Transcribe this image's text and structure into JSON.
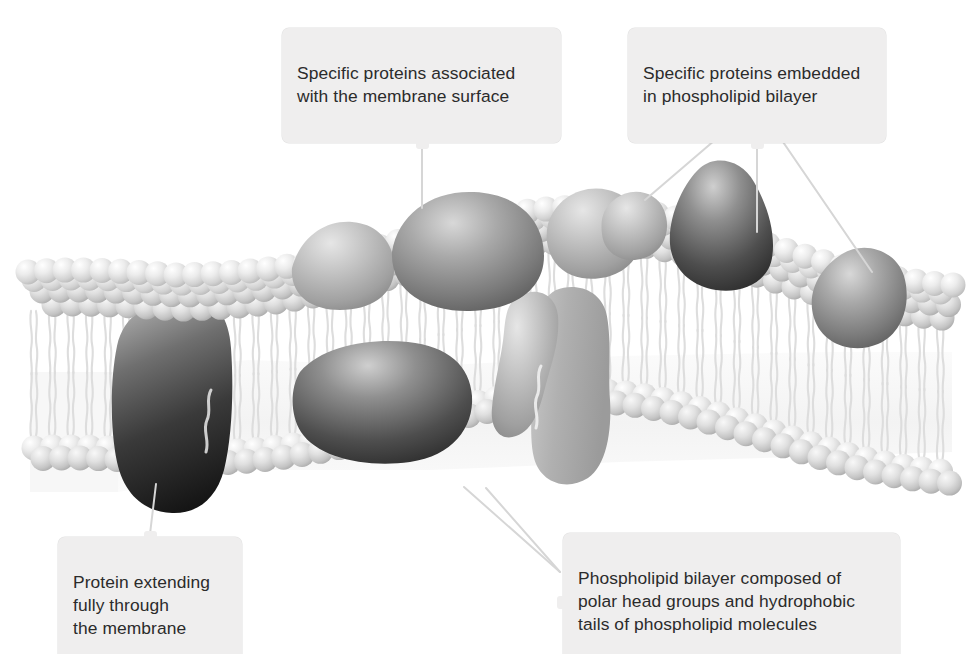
{
  "diagram": {
    "type": "cell-membrane-fluid-mosaic",
    "background_color": "#ffffff",
    "callout_background_color": "#efeeee",
    "callout_text_color": "#2b2b2b",
    "leader_line_color": "#d8d8d8",
    "head_group_color": "#e3e3e3",
    "tail_color": "#f4f4f4",
    "protein_dark_color": "#3a3a3a",
    "protein_mid_color": "#8c8c8c",
    "protein_light_color": "#bcbcbc"
  },
  "callouts": [
    {
      "id": "surface-proteins",
      "text": "Specific proteins associated\nwith the membrane surface",
      "position": "top-center-left",
      "nub": "bottom",
      "leader_lines": 1
    },
    {
      "id": "embedded-proteins",
      "text": "Specific proteins embedded\nin phospholipid bilayer",
      "position": "top-right",
      "nub": "bottom",
      "leader_lines": 3
    },
    {
      "id": "transmembrane-protein",
      "text": "Protein extending\nfully through\nthe membrane",
      "position": "bottom-left",
      "nub": "top",
      "leader_lines": 1
    },
    {
      "id": "phospholipid-bilayer",
      "text": "Phospholipid bilayer composed of\npolar head groups and hydrophobic\ntails of phospholipid molecules",
      "position": "bottom-right",
      "nub": "left",
      "leader_lines": 2
    }
  ],
  "structures": {
    "head_group_label": "polar head group sphere",
    "tail_label": "hydrophobic fatty acid tail",
    "surface_protein_label": "surface-associated protein",
    "embedded_protein_label": "integral embedded protein",
    "transmembrane_protein_label": "transmembrane protein",
    "upper_leaflet_label": "upper leaflet",
    "lower_leaflet_label": "lower leaflet"
  }
}
